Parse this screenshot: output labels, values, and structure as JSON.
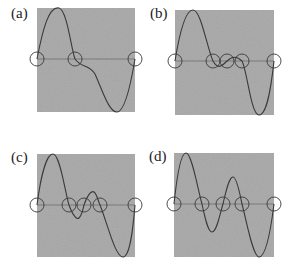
{
  "figure": {
    "colors": {
      "panel_bg": "#a3a3a3",
      "curve": "#3a3a3a",
      "axis": "#5a5a5a",
      "circle": "#3a3a3a"
    },
    "panels": [
      {
        "label": "(a)",
        "label_pos": [
          11,
          6
        ],
        "box": [
          37,
          8,
          98,
          104
        ],
        "zero_y": 51,
        "curve": "M0,51 C6,20 12,-2 22,0 C30,2 34,40 38,51 C44,60 52,56 58,66 C66,84 72,104 80,104 C88,104 94,75 98,51",
        "circles_x": [
          0,
          38,
          98
        ]
      },
      {
        "label": "(b)",
        "label_pos": [
          150,
          6
        ],
        "box": [
          175,
          10,
          99,
          105
        ],
        "zero_y": 51,
        "curve": "M0,51 C5,20 11,0 18,0 C26,0 32,38 38,51 C43,60 47,56 52,51 C57,46 62,46 67,51 C72,60 76,105 84,105 C92,105 96,78 99,51",
        "circles_x": [
          0,
          38,
          52,
          67,
          99
        ]
      },
      {
        "label": "(c)",
        "label_pos": [
          11,
          150
        ],
        "box": [
          37,
          154,
          98,
          103
        ],
        "zero_y": 51,
        "curve": "M0,51 C4,20 10,0 16,0 C23,0 28,38 32,51 C36,62 40,66 42,64 C45,61 46,55 47,51 C50,42 54,36 57,38 C60,40 61,47 63,51 C70,68 78,103 86,103 C93,103 96,75 98,51",
        "circles_x": [
          0,
          32,
          47,
          63,
          98
        ]
      },
      {
        "label": "(d)",
        "label_pos": [
          149,
          149
        ],
        "box": [
          174,
          153,
          100,
          104
        ],
        "zero_y": 51,
        "curve": "M0,51 C3,22 7,0 12,0 C18,0 24,38 28,51 C31,65 34,79 38,79 C43,79 46,60 49,51 C52,38 55,24 59,24 C63,24 66,42 68,51 C73,70 79,104 85,104 C92,104 97,75 100,51",
        "circles_x": [
          0,
          28,
          49,
          68,
          100
        ]
      }
    ],
    "circle_radius": 7
  }
}
